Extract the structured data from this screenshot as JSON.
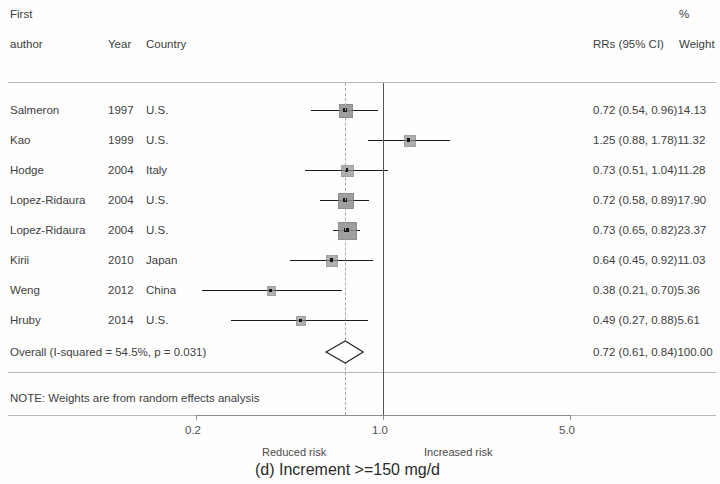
{
  "header": {
    "first_line": "First",
    "author_label": "author",
    "year_label": "Year",
    "country_label": "Country",
    "percent_label": "%",
    "effect_label": "RRs (95% CI)",
    "weight_label": "Weight"
  },
  "rows": [
    {
      "study": "Salmeron",
      "year": "1997",
      "country": "U.S.",
      "text": "0.72 (0.54, 0.96)14.13",
      "est": 0.72,
      "lo": 0.54,
      "hi": 0.96,
      "weight": 14.13
    },
    {
      "study": "Kao",
      "year": "1999",
      "country": "U.S.",
      "text": "1.25 (0.88, 1.78)11.32",
      "est": 1.25,
      "lo": 0.88,
      "hi": 1.78,
      "weight": 11.32
    },
    {
      "study": "Hodge",
      "year": "2004",
      "country": "Italy",
      "text": "0.73 (0.51, 1.04)11.28",
      "est": 0.73,
      "lo": 0.51,
      "hi": 1.04,
      "weight": 11.28
    },
    {
      "study": "Lopez-Ridaura",
      "year": "2004",
      "country": "U.S.",
      "text": "0.72 (0.58, 0.89)17.90",
      "est": 0.72,
      "lo": 0.58,
      "hi": 0.89,
      "weight": 17.9
    },
    {
      "study": "Lopez-Ridaura",
      "year": "2004",
      "country": "U.S.",
      "text": "0.73 (0.65, 0.82)23.37",
      "est": 0.73,
      "lo": 0.65,
      "hi": 0.82,
      "weight": 23.37
    },
    {
      "study": "Kirii",
      "year": "2010",
      "country": "Japan",
      "text": "0.64 (0.45, 0.92)11.03",
      "est": 0.64,
      "lo": 0.45,
      "hi": 0.92,
      "weight": 11.03
    },
    {
      "study": "Weng",
      "year": "2012",
      "country": "China",
      "text": "0.38 (0.21, 0.70)5.36",
      "est": 0.38,
      "lo": 0.21,
      "hi": 0.7,
      "weight": 5.36
    },
    {
      "study": "Hruby",
      "year": "2014",
      "country": "U.S.",
      "text": "0.49 (0.27, 0.88)5.61",
      "est": 0.49,
      "lo": 0.27,
      "hi": 0.88,
      "weight": 5.61
    }
  ],
  "overall": {
    "label": "Overall  (I-squared = 54.5%, p = 0.031)",
    "text": "0.72 (0.61, 0.84)100.00",
    "est": 0.72,
    "lo": 0.61,
    "hi": 0.84,
    "weight": 100.0
  },
  "note": "NOTE: Weights are from random effects analysis",
  "axis": {
    "ticks": [
      {
        "value": 0.2,
        "label": "0.2"
      },
      {
        "value": 1.0,
        "label": "1.0"
      },
      {
        "value": 5.0,
        "label": "5.0"
      }
    ],
    "null_value": 1.0,
    "left_note": "Reduced risk",
    "right_note": "Increased risk",
    "scale": "log"
  },
  "caption": "(d) Increment >=150 mg/d",
  "chart_data": {
    "type": "forest",
    "title": "(d) Increment >=150 mg/d",
    "xlabel": "RRs (95% CI)",
    "ylabel": "",
    "xscale": "log",
    "xlim": [
      0.2,
      5.0
    ],
    "xticks": [
      0.2,
      1.0,
      5.0
    ],
    "null_line": 1.0,
    "pooled_line": 0.72,
    "grid": false,
    "legend": "none",
    "columns": [
      "First author",
      "Year",
      "Country",
      "RRs (95% CI)",
      "% Weight"
    ],
    "studies": [
      {
        "label": "Salmeron",
        "year": 1997,
        "country": "U.S.",
        "rr": 0.72,
        "ci_low": 0.54,
        "ci_high": 0.96,
        "weight_pct": 14.13
      },
      {
        "label": "Kao",
        "year": 1999,
        "country": "U.S.",
        "rr": 1.25,
        "ci_low": 0.88,
        "ci_high": 1.78,
        "weight_pct": 11.32
      },
      {
        "label": "Hodge",
        "year": 2004,
        "country": "Italy",
        "rr": 0.73,
        "ci_low": 0.51,
        "ci_high": 1.04,
        "weight_pct": 11.28
      },
      {
        "label": "Lopez-Ridaura",
        "year": 2004,
        "country": "U.S.",
        "rr": 0.72,
        "ci_low": 0.58,
        "ci_high": 0.89,
        "weight_pct": 17.9
      },
      {
        "label": "Lopez-Ridaura",
        "year": 2004,
        "country": "U.S.",
        "rr": 0.73,
        "ci_low": 0.65,
        "ci_high": 0.82,
        "weight_pct": 23.37
      },
      {
        "label": "Kirii",
        "year": 2010,
        "country": "Japan",
        "rr": 0.64,
        "ci_low": 0.45,
        "ci_high": 0.92,
        "weight_pct": 11.03
      },
      {
        "label": "Weng",
        "year": 2012,
        "country": "China",
        "rr": 0.38,
        "ci_low": 0.21,
        "ci_high": 0.7,
        "weight_pct": 5.36
      },
      {
        "label": "Hruby",
        "year": 2014,
        "country": "U.S.",
        "rr": 0.49,
        "ci_low": 0.27,
        "ci_high": 0.88,
        "weight_pct": 5.61
      }
    ],
    "pooled": {
      "label": "Overall",
      "rr": 0.72,
      "ci_low": 0.61,
      "ci_high": 0.84,
      "weight_pct": 100.0,
      "i_squared_pct": 54.5,
      "p_value": 0.031,
      "model": "random effects"
    },
    "annotations": [
      "Reduced risk",
      "Increased risk",
      "NOTE: Weights are from random effects analysis"
    ]
  },
  "colors": {
    "text": "#404040",
    "ci": "#1c1c1c",
    "marker": "#8e8e8e",
    "null_line": "#555555",
    "pooled_line": "#a8a8a8",
    "rule": "#b8b8b8"
  }
}
